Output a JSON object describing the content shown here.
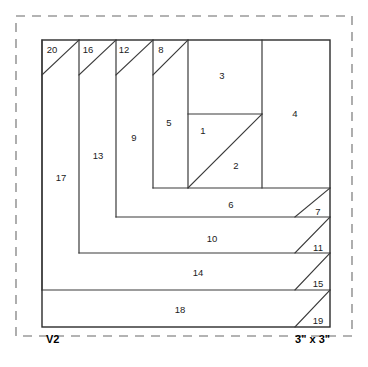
{
  "diagram": {
    "block_label": "V2",
    "size_label": "3\" x 3\"",
    "colors": {
      "line": "#3a3a3a",
      "outline": "#2b2b2b",
      "dashed_border": "#9a9a9a",
      "label_text": "#1b1b1b",
      "background": "#ffffff"
    },
    "border": {
      "style": "dashed",
      "x": 16,
      "y": 16,
      "width": 336,
      "height": 320
    },
    "block": {
      "x": 42,
      "y": 40,
      "width": 288,
      "height": 287
    },
    "pieces": [
      {
        "number": "1",
        "label_x": 203,
        "label_y": 131
      },
      {
        "number": "2",
        "label_x": 236,
        "label_y": 166
      },
      {
        "number": "3",
        "label_x": 222,
        "label_y": 76
      },
      {
        "number": "4",
        "label_x": 295,
        "label_y": 114
      },
      {
        "number": "5",
        "label_x": 169,
        "label_y": 123
      },
      {
        "number": "6",
        "label_x": 231,
        "label_y": 205
      },
      {
        "number": "7",
        "label_x": 318,
        "label_y": 212
      },
      {
        "number": "8",
        "label_x": 161,
        "label_y": 50
      },
      {
        "number": "9",
        "label_x": 134,
        "label_y": 138
      },
      {
        "number": "10",
        "label_x": 212,
        "label_y": 239
      },
      {
        "number": "11",
        "label_x": 318,
        "label_y": 248
      },
      {
        "number": "12",
        "label_x": 124,
        "label_y": 50
      },
      {
        "number": "13",
        "label_x": 98,
        "label_y": 156
      },
      {
        "number": "14",
        "label_x": 198,
        "label_y": 273
      },
      {
        "number": "15",
        "label_x": 318,
        "label_y": 284
      },
      {
        "number": "16",
        "label_x": 88,
        "label_y": 50
      },
      {
        "number": "17",
        "label_x": 61,
        "label_y": 178
      },
      {
        "number": "18",
        "label_x": 180,
        "label_y": 310
      },
      {
        "number": "19",
        "label_x": 318,
        "label_y": 321
      },
      {
        "number": "20",
        "label_x": 52,
        "label_y": 50
      }
    ],
    "seam_lines": [
      {
        "name": "center-square-diagonal",
        "x1": 188,
        "y1": 188,
        "x2": 262,
        "y2": 114
      },
      {
        "name": "center-square-top",
        "x1": 188,
        "y1": 114,
        "x2": 262,
        "y2": 114
      },
      {
        "name": "piece3-top-left-edge",
        "x1": 188,
        "y1": 40,
        "x2": 188,
        "y2": 188
      },
      {
        "name": "piece4-left-edge",
        "x1": 262,
        "y1": 40,
        "x2": 262,
        "y2": 188
      },
      {
        "name": "strip5-left-edge",
        "x1": 153,
        "y1": 40,
        "x2": 153,
        "y2": 188
      },
      {
        "name": "strip8-diagonal",
        "x1": 153,
        "y1": 75,
        "x2": 188,
        "y2": 40
      },
      {
        "name": "strip9-left-edge",
        "x1": 116,
        "y1": 40,
        "x2": 116,
        "y2": 217
      },
      {
        "name": "strip12-diagonal",
        "x1": 116,
        "y1": 75,
        "x2": 153,
        "y2": 40
      },
      {
        "name": "strip13-left-edge",
        "x1": 79,
        "y1": 40,
        "x2": 79,
        "y2": 253
      },
      {
        "name": "strip16-diagonal",
        "x1": 79,
        "y1": 75,
        "x2": 116,
        "y2": 40
      },
      {
        "name": "strip17-right-edge",
        "x1": 42,
        "y1": 40,
        "x2": 42,
        "y2": 290
      },
      {
        "name": "strip20-diagonal",
        "x1": 42,
        "y1": 75,
        "x2": 79,
        "y2": 40
      },
      {
        "name": "band6-top",
        "x1": 153,
        "y1": 188,
        "x2": 330,
        "y2": 188
      },
      {
        "name": "band6-bottom",
        "x1": 116,
        "y1": 217,
        "x2": 330,
        "y2": 217
      },
      {
        "name": "band10-bottom",
        "x1": 79,
        "y1": 253,
        "x2": 330,
        "y2": 253
      },
      {
        "name": "band14-bottom",
        "x1": 42,
        "y1": 290,
        "x2": 330,
        "y2": 290
      },
      {
        "name": "triangle7-diagonal",
        "x1": 295,
        "y1": 217,
        "x2": 330,
        "y2": 188
      },
      {
        "name": "triangle11-diagonal",
        "x1": 295,
        "y1": 253,
        "x2": 330,
        "y2": 217
      },
      {
        "name": "triangle15-diagonal",
        "x1": 295,
        "y1": 290,
        "x2": 330,
        "y2": 253
      },
      {
        "name": "triangle19-diagonal",
        "x1": 295,
        "y1": 327,
        "x2": 330,
        "y2": 290
      }
    ],
    "labels": {
      "block_x": 46,
      "block_y": 340,
      "size_x": 330,
      "size_y": 340
    }
  }
}
